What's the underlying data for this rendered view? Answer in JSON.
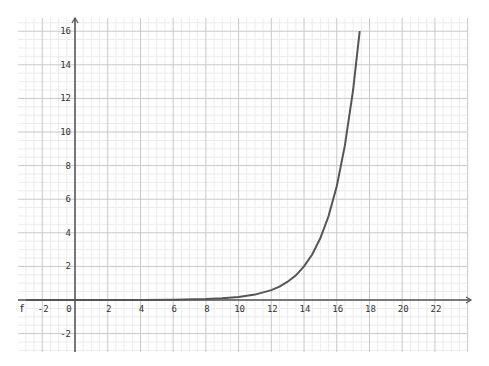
{
  "chart_data": {
    "type": "line",
    "title": "",
    "xlabel": "",
    "ylabel": "",
    "function_label": "f",
    "xlim": [
      -3.5,
      24.5
    ],
    "ylim": [
      -3.1,
      17
    ],
    "grid": true,
    "major_step": 2,
    "minor_step": 0.5,
    "x_ticks": [
      -2,
      0,
      2,
      4,
      6,
      8,
      10,
      12,
      14,
      16,
      18,
      20,
      22
    ],
    "x_tick_labels": [
      "-2",
      "0",
      "2",
      "4",
      "6",
      "8",
      "10",
      "12",
      "14",
      "16",
      "18",
      "20",
      "22"
    ],
    "y_ticks": [
      -2,
      2,
      4,
      6,
      8,
      10,
      12,
      14,
      16
    ],
    "y_tick_labels": [
      "-2",
      "2",
      "4",
      "6",
      "8",
      "10",
      "12",
      "14",
      "16"
    ],
    "series": [
      {
        "name": "f",
        "color": "#555555",
        "x": [
          -3,
          0,
          2,
          4,
          6,
          8,
          9,
          10,
          11,
          12,
          12.5,
          13,
          13.5,
          14,
          14.5,
          15,
          15.5,
          16,
          16.5,
          17,
          17.4
        ],
        "y": [
          0.0001,
          0.0004,
          0.0014,
          0.0048,
          0.016,
          0.055,
          0.1,
          0.17,
          0.32,
          0.59,
          0.8,
          1.09,
          1.47,
          2.0,
          2.71,
          3.69,
          5.0,
          6.78,
          9.2,
          12.5,
          16.0
        ]
      }
    ]
  },
  "colors": {
    "axis": "#555555",
    "major_grid": "#c8c8c8",
    "minor_grid": "#ececec",
    "curve": "#555555"
  }
}
